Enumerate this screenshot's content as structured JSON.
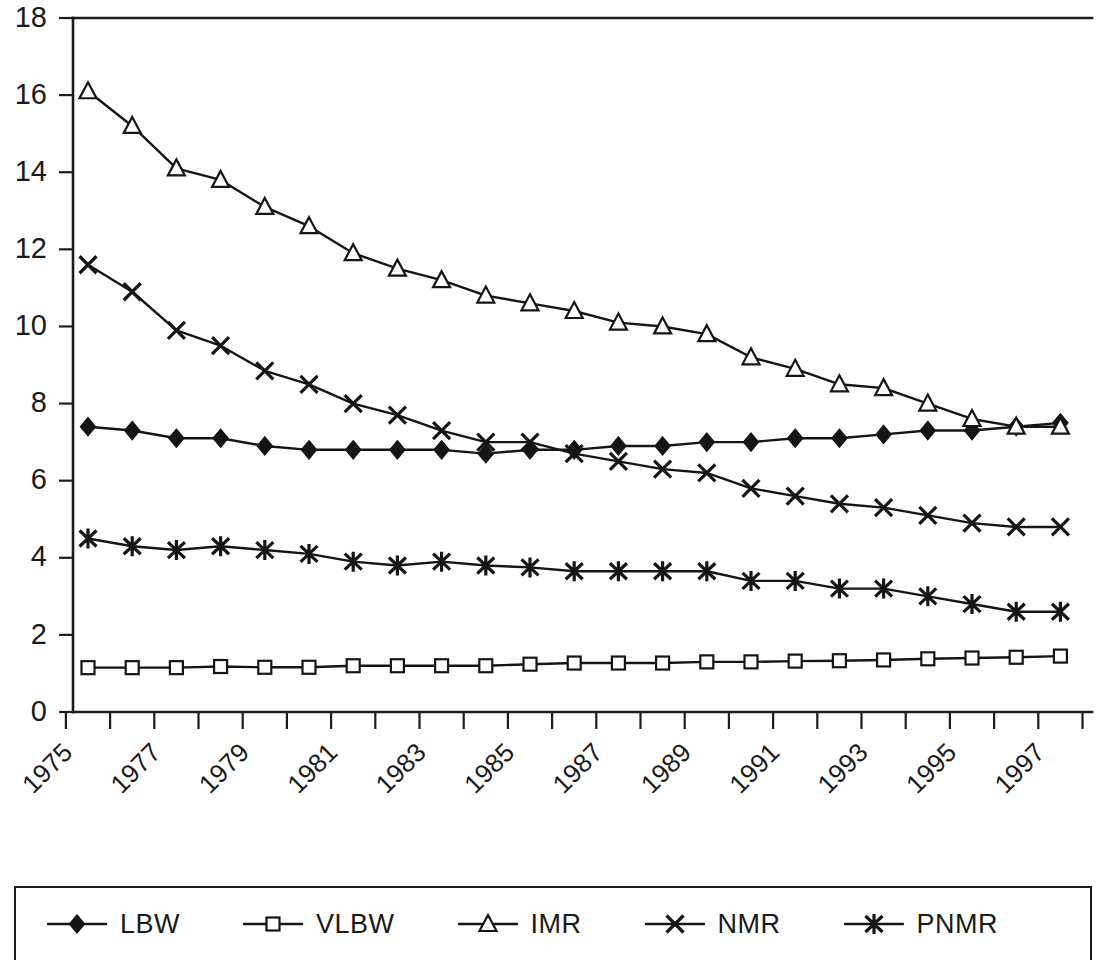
{
  "figure": {
    "background_color": "#ffffff",
    "ink_color": "#151515"
  },
  "legend": {
    "position": "bottom",
    "entries": [
      {
        "label": "LBW",
        "marker": "filled-diamond-icon"
      },
      {
        "label": "VLBW",
        "marker": "open-square-icon"
      },
      {
        "label": "IMR",
        "marker": "open-triangle-icon"
      },
      {
        "label": "NMR",
        "marker": "cross-x-icon"
      },
      {
        "label": "PNMR",
        "marker": "asterisk-star-icon"
      }
    ]
  },
  "chart_data": {
    "type": "line",
    "title": "",
    "subtitle": "",
    "xlabel": "",
    "ylabel": "",
    "grid": false,
    "legend_position": "bottom",
    "ylim": [
      0,
      18
    ],
    "yticks": [
      0,
      2,
      4,
      6,
      8,
      10,
      12,
      14,
      16,
      18
    ],
    "ytick_labels": [
      "0",
      "2",
      "4",
      "6",
      "8",
      "10",
      "12",
      "14",
      "16",
      "18"
    ],
    "x": [
      1975,
      1976,
      1977,
      1978,
      1979,
      1980,
      1981,
      1982,
      1983,
      1984,
      1985,
      1986,
      1987,
      1988,
      1989,
      1990,
      1991,
      1992,
      1993,
      1994,
      1995,
      1996,
      1997
    ],
    "xtick_labels": [
      "1975",
      "1977",
      "1979",
      "1981",
      "1983",
      "1985",
      "1987",
      "1989",
      "1991",
      "1993",
      "1995",
      "1997"
    ],
    "xtick_label_rotation": -45,
    "xtick_label_every": 2,
    "series": [
      {
        "name": "LBW",
        "marker": "filled-diamond",
        "values": [
          7.4,
          7.3,
          7.1,
          7.1,
          6.9,
          6.8,
          6.8,
          6.8,
          6.8,
          6.7,
          6.8,
          6.8,
          6.9,
          6.9,
          7.0,
          7.0,
          7.1,
          7.1,
          7.2,
          7.3,
          7.3,
          7.4,
          7.5
        ]
      },
      {
        "name": "VLBW",
        "marker": "open-square",
        "values": [
          1.15,
          1.15,
          1.15,
          1.18,
          1.16,
          1.16,
          1.2,
          1.2,
          1.2,
          1.2,
          1.24,
          1.27,
          1.27,
          1.27,
          1.3,
          1.3,
          1.32,
          1.33,
          1.35,
          1.38,
          1.4,
          1.42,
          1.45
        ]
      },
      {
        "name": "IMR",
        "marker": "open-triangle",
        "values": [
          16.1,
          15.2,
          14.1,
          13.8,
          13.1,
          12.6,
          11.9,
          11.5,
          11.2,
          10.8,
          10.6,
          10.4,
          10.1,
          10.0,
          9.8,
          9.2,
          8.9,
          8.5,
          8.4,
          8.0,
          7.6,
          7.4,
          7.4
        ]
      },
      {
        "name": "NMR",
        "marker": "cross-x",
        "values": [
          11.6,
          10.9,
          9.9,
          9.5,
          8.85,
          8.5,
          8.0,
          7.7,
          7.3,
          7.0,
          7.0,
          6.7,
          6.5,
          6.3,
          6.2,
          5.8,
          5.6,
          5.4,
          5.3,
          5.1,
          4.9,
          4.8,
          4.8
        ]
      },
      {
        "name": "PNMR",
        "marker": "asterisk-star",
        "values": [
          4.5,
          4.3,
          4.2,
          4.3,
          4.2,
          4.1,
          3.9,
          3.8,
          3.9,
          3.8,
          3.75,
          3.65,
          3.65,
          3.65,
          3.65,
          3.4,
          3.4,
          3.2,
          3.2,
          3.0,
          2.8,
          2.6,
          2.6
        ]
      }
    ]
  }
}
